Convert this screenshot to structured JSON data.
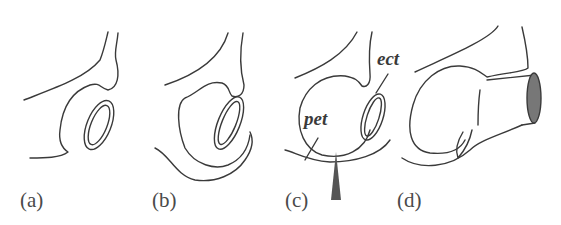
{
  "figure": {
    "panels": [
      {
        "id": "a",
        "label": "(a)"
      },
      {
        "id": "b",
        "label": "(b)"
      },
      {
        "id": "c",
        "label": "(c)"
      },
      {
        "id": "d",
        "label": "(d)"
      }
    ],
    "annotations": {
      "pet": "pet",
      "ect": "ect"
    },
    "colors": {
      "line": "#3a3a3a",
      "arrow": "#555555",
      "background": "#ffffff"
    }
  }
}
